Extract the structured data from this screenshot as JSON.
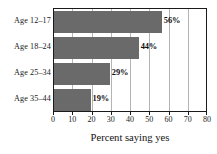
{
  "chart_data": {
    "type": "bar",
    "orientation": "horizontal",
    "title": "",
    "xlabel": "Percent saying yes",
    "ylabel": "",
    "categories": [
      "Age 12–17",
      "Age 18–24",
      "Age 25–34",
      "Age 35–44"
    ],
    "values": [
      56,
      44,
      29,
      19
    ],
    "value_labels": [
      "56%",
      "44%",
      "29%",
      "19%"
    ],
    "xlim": [
      0,
      80
    ],
    "xticks": [
      0,
      10,
      20,
      30,
      40,
      50,
      60,
      70,
      80
    ],
    "xtick_labels": [
      "0",
      "10",
      "20",
      "30",
      "40",
      "50",
      "60",
      "70",
      "80"
    ],
    "grid": "vertical",
    "legend": "none",
    "bar_color": "#6a6a6a",
    "grid_color": "#b4b4b4",
    "frame_color": "#1a1a1a",
    "background_color": "#ffffff"
  }
}
